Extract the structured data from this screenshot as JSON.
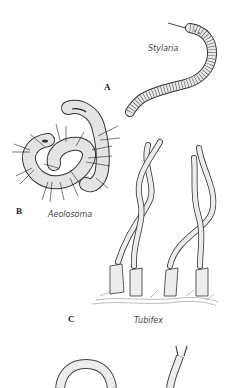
{
  "figure": {
    "panels": [
      {
        "letter": "A",
        "species": "Stylaria"
      },
      {
        "letter": "B",
        "species": "Aeolosoma"
      },
      {
        "letter": "C",
        "species": "Tubifex"
      }
    ]
  },
  "colors": {
    "background": "#ffffff",
    "ink": "#333333",
    "fill": "#e6e6e6",
    "label": "#444444"
  }
}
